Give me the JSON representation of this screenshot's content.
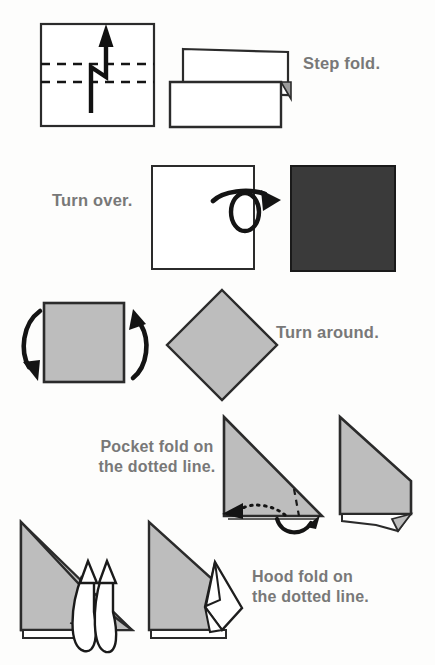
{
  "page": {
    "background_color": "#fdfdfc",
    "text_color": "#787878",
    "ink_color": "#222222",
    "paper_front_color": "#bdbdbd",
    "paper_back_color": "#3a3a3a",
    "paper_white_color": "#ffffff"
  },
  "steps": [
    {
      "id": "step-fold",
      "caption": "Step fold.",
      "caption_lines": [
        "Step fold."
      ],
      "caption_align": "left",
      "before_shape": "square-with-two-dashed-lines",
      "arrow_symbol": "step-fold-zigzag-arrow",
      "after_shape": "two-overlapping-rectangles"
    },
    {
      "id": "turn-over",
      "caption": "Turn over.",
      "caption_lines": [
        "Turn over."
      ],
      "caption_align": "left",
      "before_shape": "white-square",
      "arrow_symbol": "turn-over-loop-arrow",
      "after_shape": "dark-square"
    },
    {
      "id": "turn-around",
      "caption": "Turn around.",
      "caption_lines": [
        "Turn around."
      ],
      "caption_align": "left",
      "before_shape": "gray-square",
      "arrow_symbol": "rotation-double-arrow",
      "after_shape": "gray-diamond"
    },
    {
      "id": "pocket-fold",
      "caption": "Pocket fold on the dotted line.",
      "caption_lines": [
        "Pocket fold on",
        "the dotted line."
      ],
      "caption_align": "center",
      "before_shape": "gray-triangle-with-dashed-fold-line",
      "arrow_symbol": "pocket-fold-dotted-arrow",
      "after_shape": "gray-shape-with-folded-corner"
    },
    {
      "id": "hood-fold",
      "caption": "Hood fold on the dotted line.",
      "caption_lines": [
        "Hood fold on",
        "the dotted line."
      ],
      "caption_align": "left",
      "before_shape": "gray-shape-with-hollow-loop-arrows",
      "arrow_symbol": "hood-fold-hollow-double-arrow",
      "after_shape": "gray-shape-with-raised-hood"
    }
  ]
}
